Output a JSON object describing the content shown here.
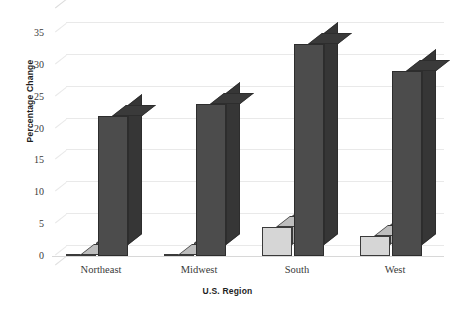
{
  "chart_data": {
    "type": "bar",
    "title": "",
    "subtitle": "",
    "xlabel": "U.S. Region",
    "ylabel": "Percentage Change",
    "categories": [
      "Northeast",
      "Midwest",
      "South",
      "West"
    ],
    "series": [
      {
        "name": "light-series",
        "values": [
          0.2,
          0.2,
          4.5,
          3.2
        ]
      },
      {
        "name": "dark-series",
        "values": [
          22.0,
          23.8,
          33.3,
          29.0
        ]
      }
    ],
    "ylim": [
      0,
      35
    ],
    "yticks": [
      0,
      5,
      10,
      15,
      20,
      25,
      30,
      35
    ],
    "ytick_labels": [
      "0",
      "5",
      "10",
      "15",
      "20",
      "25",
      "30",
      "35"
    ],
    "grid": true,
    "legend": "none",
    "style": "3d-bar",
    "colors": {
      "light_bar": "#d6d6d6",
      "light_bar_top": "#bdbdbd",
      "dark_bar": "#4c4c4c",
      "dark_bar_top": "#3a3a3a",
      "gridline": "#e9e9e9",
      "text": "#2b2b2b",
      "background": "#ffffff"
    }
  }
}
